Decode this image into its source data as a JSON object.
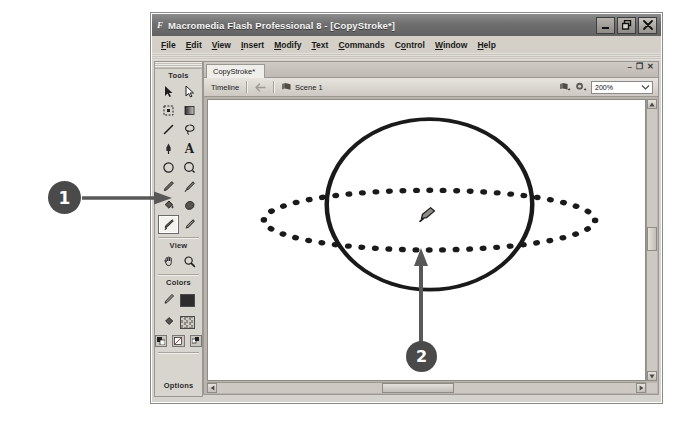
{
  "window": {
    "title": "Macromedia Flash Professional 8 - [CopyStroke*]",
    "app_glyph": "F",
    "controls": {
      "minimize": "minimize-button",
      "restore": "restore-button",
      "close": "close-button"
    }
  },
  "menubar": {
    "items": [
      {
        "label": "File",
        "accel": "F"
      },
      {
        "label": "Edit",
        "accel": "E"
      },
      {
        "label": "View",
        "accel": "V"
      },
      {
        "label": "Insert",
        "accel": "I"
      },
      {
        "label": "Modify",
        "accel": "M"
      },
      {
        "label": "Text",
        "accel": "T"
      },
      {
        "label": "Commands",
        "accel": "C"
      },
      {
        "label": "Control",
        "accel": "o"
      },
      {
        "label": "Window",
        "accel": "W"
      },
      {
        "label": "Help",
        "accel": "H"
      }
    ]
  },
  "tools_panel": {
    "sections": {
      "tools": "Tools",
      "view": "View",
      "colors": "Colors",
      "options": "Options"
    },
    "tools": [
      {
        "name": "selection-tool",
        "icon": "arrow-black",
        "selected": false
      },
      {
        "name": "subselection-tool",
        "icon": "arrow-white",
        "selected": false
      },
      {
        "name": "free-transform-tool",
        "icon": "transform-box",
        "selected": false
      },
      {
        "name": "gradient-transform-tool",
        "icon": "gradient-box",
        "selected": false
      },
      {
        "name": "line-tool",
        "icon": "line",
        "selected": false
      },
      {
        "name": "lasso-tool",
        "icon": "lasso",
        "selected": false
      },
      {
        "name": "pen-tool",
        "icon": "pen-nib",
        "selected": false
      },
      {
        "name": "text-tool",
        "icon": "letter-a",
        "selected": false
      },
      {
        "name": "oval-tool",
        "icon": "circle-outline",
        "selected": false
      },
      {
        "name": "rectangle-tool",
        "icon": "circle-corner",
        "selected": false
      },
      {
        "name": "pencil-tool",
        "icon": "pencil",
        "selected": false
      },
      {
        "name": "brush-tool",
        "icon": "brush",
        "selected": false
      },
      {
        "name": "paint-bucket-tool",
        "icon": "paint-bucket",
        "selected": false
      },
      {
        "name": "fill-transform-tool",
        "icon": "fill-blob",
        "selected": false
      },
      {
        "name": "ink-bottle-tool",
        "icon": "ink-bottle",
        "selected": true
      },
      {
        "name": "eyedropper-tool",
        "icon": "eyedropper",
        "selected": false
      }
    ],
    "view_tools": [
      {
        "name": "hand-tool",
        "icon": "hand"
      },
      {
        "name": "zoom-tool",
        "icon": "magnifier"
      }
    ],
    "colors": [
      {
        "name": "stroke-color",
        "icon": "pencil",
        "swatch": "#2d2d2d"
      },
      {
        "name": "fill-color",
        "icon": "bucket",
        "swatch": "#2d2d2d"
      }
    ],
    "color_buttons": [
      {
        "name": "black-and-white-button"
      },
      {
        "name": "no-color-button"
      },
      {
        "name": "swap-colors-button"
      }
    ]
  },
  "document": {
    "tab_label": "CopyStroke*",
    "panel_controls": {
      "minimize": "–",
      "restore": "❐",
      "close": "✕"
    }
  },
  "timeline": {
    "label": "Timeline",
    "back_button": "back-arrow",
    "scene_icon": "scene-icon",
    "scene_label": "Scene 1",
    "edit_scene_button": "edit-scene-icon",
    "edit_symbols_button": "edit-symbols-icon",
    "zoom_value": "200%",
    "zoom_dropdown_arrow": "chevron-down-icon"
  },
  "stage": {
    "shapes": [
      {
        "name": "circle-shape",
        "type": "circle",
        "stroke": "solid",
        "stroke_color": "#1a1a1a"
      },
      {
        "name": "ellipse-shape",
        "type": "ellipse",
        "stroke": "dotted",
        "stroke_color": "#1a1a1a"
      }
    ],
    "cursor": {
      "name": "ink-bottle-cursor"
    }
  },
  "callouts": [
    {
      "name": "callout-1",
      "number": "1",
      "target": "ink-bottle-tool",
      "color": "#4a4a4a"
    },
    {
      "name": "callout-2",
      "number": "2",
      "target": "ellipse-shape",
      "color": "#4a4a4a"
    }
  ],
  "scrollbars": {
    "vertical": {
      "up": "▲",
      "down": "▼"
    },
    "horizontal": {
      "left": "◀",
      "right": "▶"
    }
  }
}
